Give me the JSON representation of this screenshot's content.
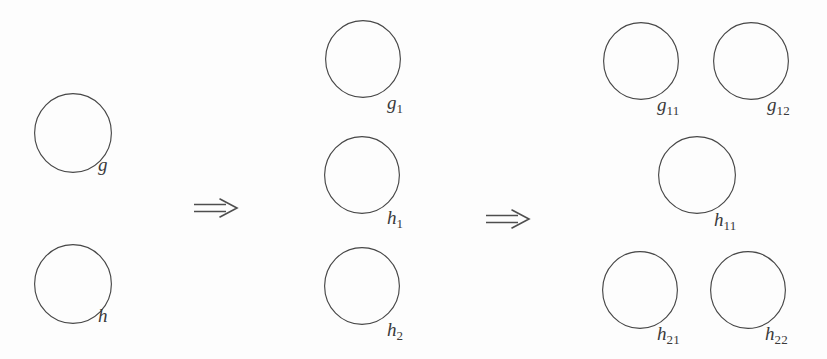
{
  "figure": {
    "background_color": "#fdfdfd",
    "stroke_color": "#474747",
    "label_color": "#3a3a3a",
    "width": 827,
    "height": 359
  },
  "stages": [
    {
      "name": "stage-1",
      "nodes": [
        {
          "id": "g",
          "base": "g",
          "subscript": "",
          "cx": 73,
          "cy": 133,
          "rx": 39,
          "ry": 40,
          "label_x": 98,
          "label_y": 155
        },
        {
          "id": "h",
          "base": "h",
          "subscript": "",
          "cx": 73,
          "cy": 284,
          "rx": 39,
          "ry": 40,
          "label_x": 98,
          "label_y": 306
        }
      ]
    },
    {
      "name": "stage-2",
      "nodes": [
        {
          "id": "g1",
          "base": "g",
          "subscript": "1",
          "cx": 363,
          "cy": 59,
          "rx": 38,
          "ry": 39,
          "label_x": 387,
          "label_y": 93
        },
        {
          "id": "h1",
          "base": "h",
          "subscript": "1",
          "cx": 362,
          "cy": 175,
          "rx": 38,
          "ry": 39,
          "label_x": 387,
          "label_y": 208
        },
        {
          "id": "h2",
          "base": "h",
          "subscript": "2",
          "cx": 362,
          "cy": 286,
          "rx": 38,
          "ry": 39,
          "label_x": 387,
          "label_y": 320
        }
      ]
    },
    {
      "name": "stage-3",
      "nodes": [
        {
          "id": "g11",
          "base": "g",
          "subscript": "11",
          "cx": 641,
          "cy": 61,
          "rx": 38,
          "ry": 39,
          "label_x": 657,
          "label_y": 95
        },
        {
          "id": "g12",
          "base": "g",
          "subscript": "12",
          "cx": 751,
          "cy": 61,
          "rx": 38,
          "ry": 39,
          "label_x": 767,
          "label_y": 95
        },
        {
          "id": "h11",
          "base": "h",
          "subscript": "11",
          "cx": 697,
          "cy": 175,
          "rx": 39,
          "ry": 39,
          "label_x": 714,
          "label_y": 210
        },
        {
          "id": "h21",
          "base": "h",
          "subscript": "21",
          "cx": 640,
          "cy": 290,
          "rx": 38,
          "ry": 39,
          "label_x": 657,
          "label_y": 324
        },
        {
          "id": "h22",
          "base": "h",
          "subscript": "22",
          "cx": 748,
          "cy": 290,
          "rx": 38,
          "ry": 39,
          "label_x": 765,
          "label_y": 324
        }
      ]
    }
  ],
  "arrows": [
    {
      "id": "arrow-1",
      "glyph": "implies-double-arrow",
      "x": 194,
      "y": 198,
      "width": 45,
      "height": 20
    },
    {
      "id": "arrow-2",
      "glyph": "implies-double-arrow",
      "x": 486,
      "y": 209,
      "width": 45,
      "height": 20
    }
  ]
}
